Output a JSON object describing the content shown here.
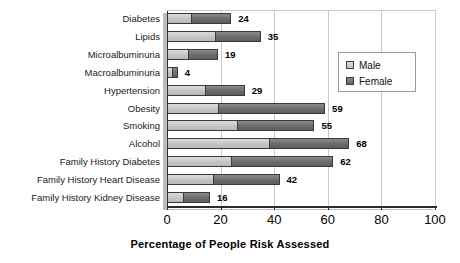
{
  "chart_data": {
    "type": "bar",
    "orientation": "horizontal",
    "stacked": true,
    "title": "",
    "xlabel": "Percentage of People Risk Assessed",
    "ylabel": "",
    "xlim": [
      0,
      100
    ],
    "xticks": [
      0,
      20,
      40,
      60,
      80,
      100
    ],
    "grid": true,
    "grid_axis": "x",
    "legend_position": "upper right inside plot",
    "categories": [
      "Diabetes",
      "Lipids",
      "Microalbuminuria",
      "Macroalbuminuria",
      "Hypertension",
      "Obesity",
      "Smoking",
      "Alcohol",
      "Family History Diabetes",
      "Family History Heart Disease",
      "Family History Kidney Disease"
    ],
    "series": [
      {
        "name": "Male",
        "color": "#c6c6c6",
        "values": [
          9,
          18,
          8,
          2,
          14,
          19,
          26,
          38,
          24,
          17,
          6
        ]
      },
      {
        "name": "Female",
        "color": "#6f6f6f",
        "values": [
          15,
          17,
          11,
          2,
          15,
          40,
          29,
          30,
          38,
          25,
          10
        ]
      }
    ],
    "totals": [
      24,
      35,
      19,
      4,
      29,
      59,
      55,
      68,
      62,
      42,
      16
    ],
    "data_labels": [
      "24",
      "35",
      "19",
      "4",
      "29",
      "59",
      "55",
      "68",
      "62",
      "42",
      "16"
    ],
    "xtick_labels": [
      "0",
      "20",
      "40",
      "60",
      "80",
      "100"
    ]
  },
  "legend": {
    "items": [
      {
        "label": "Male",
        "color": "#c6c6c6"
      },
      {
        "label": "Female",
        "color": "#6f6f6f"
      }
    ]
  }
}
